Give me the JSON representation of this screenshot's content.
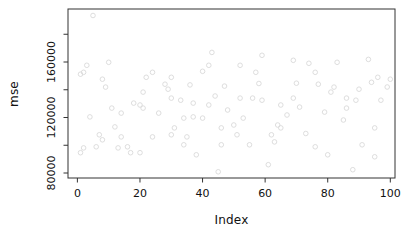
{
  "window": {
    "width": 414,
    "height": 239,
    "background": "#ffffff"
  },
  "chart": {
    "xlabel": "Index",
    "ylabel": "mse",
    "x_axis": {
      "ticks": [
        0,
        20,
        40,
        60,
        80,
        100
      ],
      "labels": [
        "0",
        "20",
        "40",
        "60",
        "80",
        "100"
      ]
    },
    "y_axis": {
      "ticks": [
        80000,
        100000,
        120000,
        140000,
        160000,
        180000
      ],
      "labels": [
        "80000",
        "",
        "120000",
        "",
        "160000",
        ""
      ]
    },
    "axis_color": "#333333",
    "text_color": "#111111"
  },
  "chart_data": {
    "type": "scatter",
    "title": "",
    "xlabel": "Index",
    "ylabel": "mse",
    "xlim": [
      -3,
      101.5
    ],
    "ylim": [
      76400,
      198200
    ],
    "grid": false,
    "legend": null,
    "marker": {
      "shape": "open-circle",
      "color": "#d9d9d9",
      "radius_px": 2.3,
      "stroke_width_px": 0.9
    },
    "x": [
      5,
      3,
      2,
      1,
      10,
      8,
      9,
      22,
      21,
      43,
      42,
      40,
      30,
      28,
      29,
      47,
      24,
      59,
      52,
      57,
      69,
      74,
      83,
      76,
      70,
      82,
      94,
      96,
      81,
      93,
      100,
      77,
      90,
      18,
      20,
      21,
      11,
      14,
      4,
      12,
      14,
      7,
      8,
      2,
      1,
      6,
      13,
      16,
      17,
      20,
      30,
      33,
      37,
      42,
      48,
      26,
      34,
      37,
      40,
      31,
      24,
      30,
      35,
      34,
      38,
      46,
      52,
      56,
      59,
      65,
      69,
      71,
      67,
      53,
      50,
      64,
      65,
      62,
      51,
      55,
      61,
      86,
      89,
      86,
      79,
      85,
      95,
      91,
      76,
      80,
      95,
      88,
      46,
      45,
      63,
      97,
      99,
      36,
      44,
      58,
      73
    ],
    "y": [
      193500,
      157600,
      152600,
      151200,
      159800,
      147600,
      141900,
      149000,
      138300,
      166900,
      157600,
      153300,
      149000,
      144000,
      140400,
      142600,
      152600,
      164800,
      157600,
      152600,
      161200,
      159100,
      159800,
      152600,
      144700,
      141900,
      145400,
      149000,
      138300,
      161900,
      147600,
      144000,
      140400,
      130400,
      129000,
      126800,
      126800,
      123200,
      120400,
      113200,
      106000,
      107500,
      103900,
      98100,
      94600,
      98900,
      98100,
      98900,
      94600,
      94600,
      134000,
      132500,
      130400,
      129000,
      125400,
      123200,
      119600,
      120400,
      119600,
      112500,
      106000,
      107500,
      106000,
      100300,
      93100,
      112500,
      134000,
      134000,
      132500,
      129000,
      134000,
      127500,
      121800,
      119600,
      114600,
      114600,
      112500,
      107500,
      107500,
      100300,
      86000,
      134000,
      132500,
      126800,
      123900,
      118200,
      112500,
      100300,
      98900,
      93100,
      91700,
      82400,
      100300,
      80900,
      102400,
      132500,
      142000,
      143500,
      135500,
      144500,
      108500
    ]
  }
}
